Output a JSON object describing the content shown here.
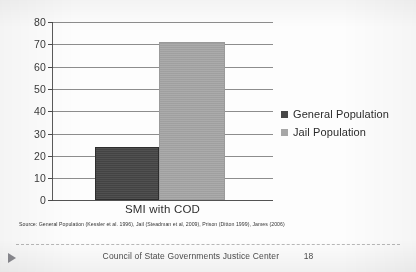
{
  "chart_data": {
    "type": "bar",
    "title": "",
    "categories": [
      "SMI with COD"
    ],
    "series": [
      {
        "name": "General Population",
        "values": [
          24
        ],
        "color": "#474747"
      },
      {
        "name": "Jail Population",
        "values": [
          71
        ],
        "color": "#a6a6a6"
      }
    ],
    "xlabel": "SMI with COD",
    "ylabel": "",
    "ylim": [
      0,
      80
    ],
    "ytick_step": 10,
    "yticks": [
      "80",
      "70",
      "60",
      "50",
      "40",
      "30",
      "20",
      "10",
      "0"
    ],
    "grid": true,
    "legend_position": "right"
  },
  "legend": {
    "items": [
      {
        "label": "General Population",
        "color": "#474747"
      },
      {
        "label": "Jail Population",
        "color": "#a6a6a6"
      }
    ]
  },
  "axis": {
    "x_category_label": "SMI with COD"
  },
  "source_note": {
    "text": "Source: General Population (Kessler et al. 1996), Jail (Steadman et al, 2009), Prison (Ditton 1999), James (2006)"
  },
  "footer": {
    "organization": "Council of State Governments Justice Center",
    "page_number": "18",
    "play_icon": "play-triangle-icon"
  }
}
